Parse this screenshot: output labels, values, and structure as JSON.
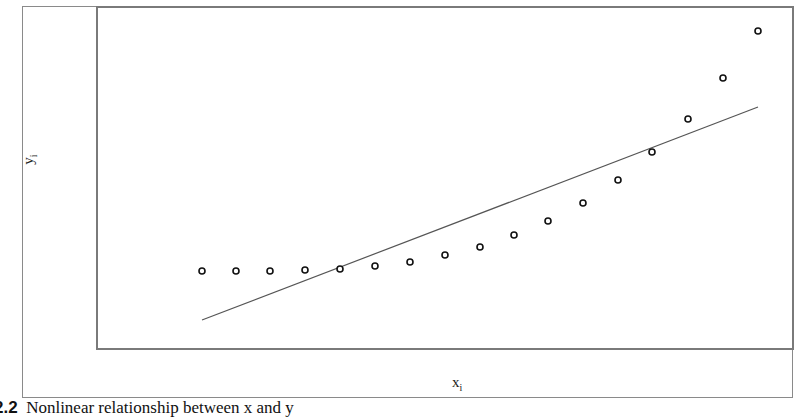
{
  "chart_data": {
    "type": "scatter",
    "title": "",
    "xlabel": "x_i",
    "ylabel": "y_i",
    "grid": false,
    "legend": null,
    "axis_ticks": "none",
    "points_pixel_space": {
      "x": [
        202,
        236,
        270,
        305,
        340,
        375,
        410,
        445,
        480,
        514,
        548,
        583,
        618,
        652,
        688,
        723,
        758
      ],
      "y": [
        271,
        271,
        271,
        270,
        269,
        266,
        262,
        255,
        247,
        235,
        221,
        203,
        180,
        152,
        119,
        78,
        31
      ]
    },
    "series": [
      {
        "name": "observations",
        "kind": "scatter",
        "marker": "open-circle",
        "x": [
          1,
          2,
          3,
          4,
          5,
          6,
          7,
          8,
          9,
          10,
          11,
          12,
          13,
          14,
          15,
          16,
          17
        ],
        "values": [
          0.0,
          0.0,
          0.0,
          0.3,
          0.6,
          1.5,
          2.7,
          4.8,
          7.2,
          10.7,
          14.9,
          20.2,
          27.0,
          35.3,
          45.1,
          57.2,
          71.1
        ]
      },
      {
        "name": "linear fit",
        "kind": "line",
        "x": [
          1,
          17
        ],
        "values": [
          -14.5,
          48.4
        ]
      }
    ]
  },
  "labels": {
    "x_axis_main": "x",
    "x_axis_sub": "i",
    "y_axis_main": "y",
    "y_axis_sub": "i"
  },
  "caption": {
    "number": "2.2",
    "text": "Nonlinear relationship between x and y"
  },
  "style": {
    "point_color": "#111111",
    "line_color": "#555555",
    "frame_color": "#7a7a7a"
  },
  "geometry": {
    "plot_box": {
      "x": 97,
      "y": 7,
      "w": 696,
      "h": 342
    },
    "fit_line": {
      "x1": 202,
      "y1": 320,
      "x2": 758,
      "y2": 107
    }
  }
}
